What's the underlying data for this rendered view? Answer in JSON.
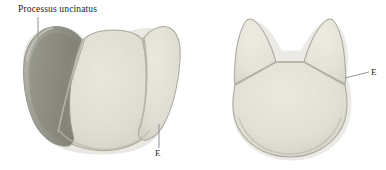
{
  "figure": {
    "background_color": "#ffffff",
    "width": 386,
    "height": 170,
    "panels": [
      {
        "id": "left-specimen",
        "name": "left-specimen",
        "description": "Three-lobed bone in cranial view with shaded uncinate process on the left",
        "parts": [
          {
            "name": "uncinate-process-lobe",
            "fill": "#8d8d82",
            "shaded": true
          },
          {
            "name": "central-body-lobe",
            "fill": "#e3e1d7",
            "shaded": false
          },
          {
            "name": "right-lateral-lobe",
            "fill": "#e3e1d7",
            "shaded": false
          }
        ]
      },
      {
        "id": "right-specimen",
        "name": "right-specimen",
        "description": "Rounded bone with two pointed superior horns separated by sutures",
        "parts": [
          {
            "name": "left-horn",
            "fill": "#e6e4da",
            "shaded": false
          },
          {
            "name": "right-horn",
            "fill": "#e6e4da",
            "shaded": false
          },
          {
            "name": "main-body",
            "fill": "#e3e1d7",
            "shaded": false
          }
        ]
      }
    ]
  },
  "labels": {
    "uncinatus": "Processus uncinatus",
    "e_left": "E",
    "e_right": "E"
  },
  "colors": {
    "background": "#ffffff",
    "bone_light": "#e3e1d7",
    "bone_light_alt": "#e6e4da",
    "bone_shaded": "#8d8d82",
    "outline": "#a9a79a",
    "suture": "#b5b3a6",
    "leader_line": "#9a9a9a",
    "text": "#1b1b1b"
  },
  "leaders": [
    {
      "name": "leader-uncinatus",
      "from_label": "Processus uncinatus",
      "to_part": "uncinate-process-lobe",
      "orientation": "vertical"
    },
    {
      "name": "leader-e-left",
      "from_label": "E",
      "to_part": "right-lateral-suture",
      "orientation": "vertical"
    },
    {
      "name": "leader-e-right",
      "from_label": "E",
      "to_part": "right-horn-suture",
      "orientation": "horizontal"
    }
  ]
}
